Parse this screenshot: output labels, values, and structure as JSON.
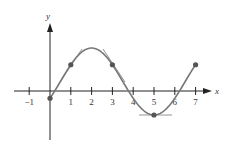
{
  "figure": {
    "axes": {
      "x_label": "x",
      "y_label": "y",
      "x_ticks": [
        -1,
        1,
        2,
        3,
        4,
        5,
        6,
        7
      ],
      "x_tick_labels": [
        "−1",
        "1",
        "2",
        "3",
        "4",
        "5",
        "6",
        "7"
      ]
    },
    "points": [
      {
        "x": 0,
        "note": "start point"
      },
      {
        "x": 1,
        "note": "tangent shown"
      },
      {
        "x": 3,
        "note": "tangent shown"
      },
      {
        "x": 5,
        "note": "minimum, horizontal tangent"
      },
      {
        "x": 7,
        "note": "end point"
      }
    ],
    "colors": {
      "curve": "#777777",
      "axis": "#222222",
      "point": "#555555",
      "tangent": "#888888"
    }
  }
}
